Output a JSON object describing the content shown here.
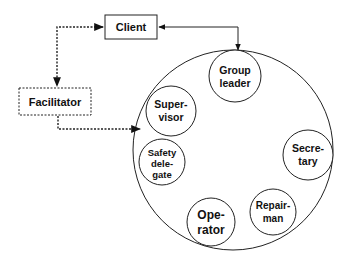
{
  "diagram": {
    "client": {
      "label": "Client"
    },
    "facilitator": {
      "label": "Facilitator"
    },
    "roles": [
      {
        "id": "group-leader",
        "lines": [
          "Group",
          "leader"
        ]
      },
      {
        "id": "supervisor",
        "lines": [
          "Super-",
          "visor"
        ]
      },
      {
        "id": "secretary",
        "lines": [
          "Secre-",
          "tary"
        ]
      },
      {
        "id": "safety-delegate",
        "lines": [
          "Safety",
          "dele-",
          "gate"
        ]
      },
      {
        "id": "repairman",
        "lines": [
          "Repair-",
          "man"
        ]
      },
      {
        "id": "operator",
        "lines": [
          "Ope-",
          "rator"
        ]
      }
    ],
    "edges": [
      {
        "from": "client",
        "to": "facilitator",
        "style": "dotted",
        "bidirectional": true
      },
      {
        "from": "client",
        "to": "group-leader",
        "style": "solid",
        "bidirectional": true
      },
      {
        "from": "facilitator",
        "to": "group",
        "style": "dotted",
        "bidirectional": false
      }
    ]
  }
}
